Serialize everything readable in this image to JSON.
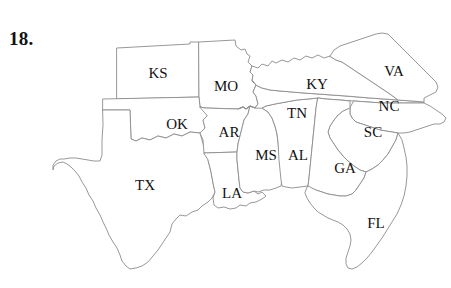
{
  "figure": {
    "question_number": "18.",
    "background_color": "#ffffff",
    "outline_color": "#8c8c8c",
    "label_color": "#111111"
  },
  "map": {
    "name": "southeast-us-states-map",
    "states": [
      {
        "abbr": "KS",
        "name": "Kansas",
        "label_x": 158,
        "label_y": 73
      },
      {
        "abbr": "MO",
        "name": "Missouri",
        "label_x": 226,
        "label_y": 86
      },
      {
        "abbr": "KY",
        "name": "Kentucky",
        "label_x": 317,
        "label_y": 84
      },
      {
        "abbr": "VA",
        "name": "Virginia",
        "label_x": 394,
        "label_y": 71
      },
      {
        "abbr": "OK",
        "name": "Oklahoma",
        "label_x": 177,
        "label_y": 124
      },
      {
        "abbr": "TN",
        "name": "Tennessee",
        "label_x": 297,
        "label_y": 113
      },
      {
        "abbr": "NC",
        "name": "North Carolina",
        "label_x": 389,
        "label_y": 106
      },
      {
        "abbr": "AR",
        "name": "Arkansas",
        "label_x": 229,
        "label_y": 132
      },
      {
        "abbr": "SC",
        "name": "South Carolina",
        "label_x": 373,
        "label_y": 132
      },
      {
        "abbr": "MS",
        "name": "Mississippi",
        "label_x": 266,
        "label_y": 155
      },
      {
        "abbr": "AL",
        "name": "Alabama",
        "label_x": 298,
        "label_y": 155
      },
      {
        "abbr": "GA",
        "name": "Georgia",
        "label_x": 345,
        "label_y": 168
      },
      {
        "abbr": "TX",
        "name": "Texas",
        "label_x": 145,
        "label_y": 185
      },
      {
        "abbr": "LA",
        "name": "Louisiana",
        "label_x": 232,
        "label_y": 193
      },
      {
        "abbr": "FL",
        "name": "Florida",
        "label_x": 376,
        "label_y": 223
      }
    ]
  }
}
